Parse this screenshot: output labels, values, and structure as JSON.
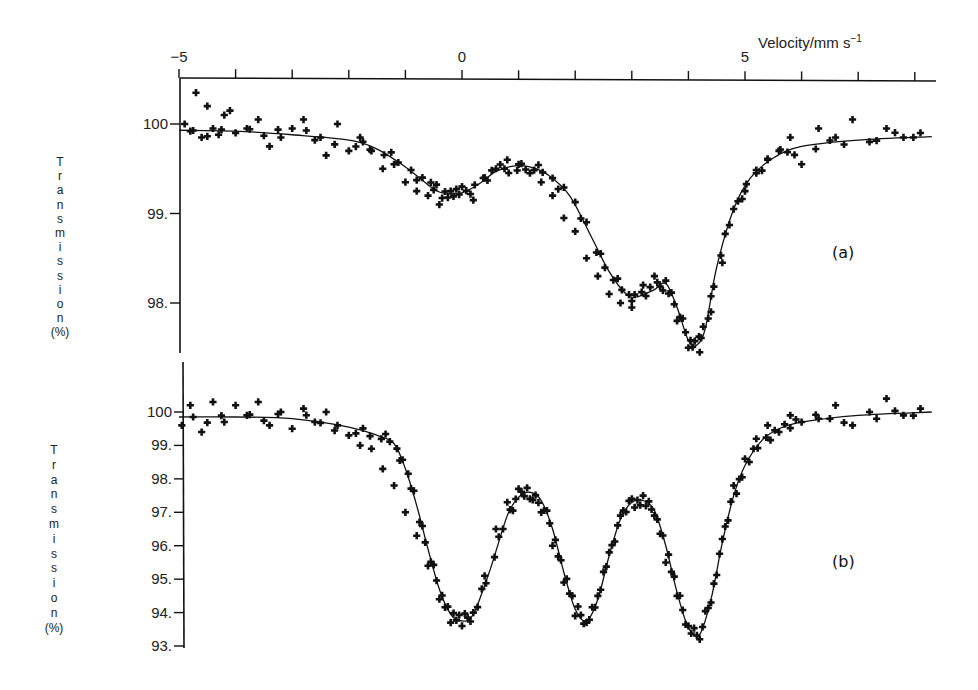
{
  "figure": {
    "x_axis_title": "Velocity/mm s",
    "x_axis_title_sup": "−1",
    "x_ticks_labeled": [
      {
        "value": -5,
        "label": "−5"
      },
      {
        "value": 0,
        "label": "0"
      },
      {
        "value": 5,
        "label": "5"
      }
    ],
    "x_tick_step": 1,
    "x_range": [
      -5,
      8.3
    ],
    "y_axis_title_letters": [
      "T",
      "r",
      "a",
      "n",
      "s",
      "m",
      "i",
      "s",
      "s",
      "i",
      "o",
      "n"
    ],
    "y_axis_unit": "(%)"
  },
  "chart_data": [
    {
      "type": "scatter",
      "panel_label": "(a)",
      "title": "",
      "xlabel": "Velocity/mm s^-1",
      "ylabel": "Transmission (%)",
      "xlim": [
        -5,
        8.3
      ],
      "ylim": [
        97.4,
        100.6
      ],
      "y_ticks": [
        {
          "value": 100,
          "label": "100"
        },
        {
          "value": 99,
          "label": "99."
        },
        {
          "value": 98,
          "label": "98."
        }
      ],
      "grid": false,
      "legend": null,
      "series": [
        {
          "name": "fit",
          "kind": "line",
          "x": [
            -5.0,
            -4.0,
            -3.0,
            -2.0,
            -1.5,
            -1.0,
            -0.6,
            -0.4,
            -0.2,
            0.0,
            0.3,
            0.6,
            0.9,
            1.2,
            1.5,
            1.9,
            2.3,
            2.6,
            2.9,
            3.1,
            3.4,
            3.6,
            3.8,
            4.0,
            4.15,
            4.3,
            4.5,
            4.8,
            5.1,
            5.5,
            6.0,
            7.0,
            8.3
          ],
          "y": [
            99.93,
            99.92,
            99.88,
            99.82,
            99.72,
            99.52,
            99.32,
            99.24,
            99.22,
            99.23,
            99.33,
            99.47,
            99.53,
            99.52,
            99.44,
            99.2,
            98.72,
            98.35,
            98.1,
            98.07,
            98.15,
            98.22,
            97.95,
            97.58,
            97.53,
            97.72,
            98.4,
            99.05,
            99.4,
            99.62,
            99.75,
            99.82,
            99.86
          ]
        },
        {
          "name": "measured",
          "kind": "scatter",
          "marker": "+",
          "x": [
            -4.9,
            -4.8,
            -4.7,
            -4.6,
            -4.5,
            -4.4,
            -4.3,
            -4.2,
            -4.1,
            -4.0,
            -3.8,
            -3.6,
            -3.4,
            -3.2,
            -3.0,
            -2.8,
            -2.6,
            -2.4,
            -2.2,
            -2.0,
            -1.8,
            -1.6,
            -1.4,
            -1.2,
            -1.0,
            -0.8,
            -0.6,
            -0.4,
            -0.2,
            0.0,
            0.2,
            0.4,
            0.6,
            0.8,
            1.0,
            1.2,
            1.4,
            1.6,
            1.8,
            2.0,
            2.2,
            2.4,
            2.6,
            2.8,
            3.0,
            3.2,
            3.4,
            3.6,
            3.8,
            4.0,
            4.2,
            4.4,
            4.6,
            4.8,
            5.0,
            5.2,
            5.4,
            5.6,
            5.8,
            6.0,
            6.3,
            6.6,
            6.9,
            7.2,
            7.5,
            7.8,
            8.1
          ],
          "y": [
            100.0,
            99.92,
            100.35,
            99.85,
            100.2,
            99.95,
            99.88,
            100.1,
            100.15,
            99.9,
            99.95,
            100.05,
            99.75,
            99.85,
            99.95,
            100.05,
            99.82,
            99.65,
            100.0,
            99.7,
            99.85,
            99.7,
            99.5,
            99.55,
            99.35,
            99.25,
            99.2,
            99.1,
            99.25,
            99.3,
            99.15,
            99.4,
            99.5,
            99.6,
            99.55,
            99.45,
            99.35,
            99.2,
            98.95,
            98.8,
            98.5,
            98.3,
            98.1,
            98.0,
            97.95,
            98.2,
            98.3,
            98.25,
            97.8,
            97.5,
            97.45,
            97.9,
            98.45,
            99.05,
            99.25,
            99.45,
            99.6,
            99.7,
            99.85,
            99.55,
            99.95,
            99.85,
            100.05,
            99.8,
            99.95,
            99.85,
            99.9
          ]
        }
      ]
    },
    {
      "type": "scatter",
      "panel_label": "(b)",
      "title": "",
      "xlabel": "Velocity/mm s^-1",
      "ylabel": "Transmission (%)",
      "xlim": [
        -5,
        8.3
      ],
      "ylim": [
        93.0,
        101.5
      ],
      "y_ticks": [
        {
          "value": 100,
          "label": "100"
        },
        {
          "value": 99,
          "label": "99."
        },
        {
          "value": 98,
          "label": "98."
        },
        {
          "value": 97,
          "label": "97."
        },
        {
          "value": 96,
          "label": "96."
        },
        {
          "value": 95,
          "label": "95."
        },
        {
          "value": 94,
          "label": "94."
        },
        {
          "value": 93,
          "label": "93."
        }
      ],
      "grid": false,
      "legend": null,
      "series": [
        {
          "name": "fit",
          "kind": "line",
          "x": [
            -5.0,
            -4.0,
            -3.0,
            -2.0,
            -1.5,
            -1.2,
            -1.0,
            -0.8,
            -0.6,
            -0.4,
            -0.2,
            0.0,
            0.2,
            0.5,
            0.8,
            1.0,
            1.2,
            1.4,
            1.6,
            1.8,
            2.0,
            2.2,
            2.4,
            2.6,
            2.8,
            3.0,
            3.2,
            3.4,
            3.6,
            3.8,
            4.0,
            4.2,
            4.4,
            4.6,
            4.8,
            5.0,
            5.3,
            5.6,
            6.0,
            7.0,
            8.3
          ],
          "y": [
            99.85,
            99.85,
            99.8,
            99.55,
            99.3,
            99.05,
            98.3,
            97.2,
            95.9,
            94.7,
            93.95,
            93.75,
            93.95,
            95.3,
            96.9,
            97.45,
            97.6,
            97.35,
            96.5,
            95.2,
            94.1,
            93.75,
            94.4,
            95.7,
            96.8,
            97.3,
            97.35,
            97.05,
            96.0,
            94.6,
            93.55,
            93.35,
            94.4,
            96.1,
            97.5,
            98.4,
            99.15,
            99.5,
            99.7,
            99.9,
            100.0
          ]
        },
        {
          "name": "measured",
          "kind": "scatter",
          "marker": "+",
          "x": [
            -4.95,
            -4.8,
            -4.6,
            -4.4,
            -4.2,
            -4.0,
            -3.8,
            -3.6,
            -3.4,
            -3.2,
            -3.0,
            -2.8,
            -2.6,
            -2.4,
            -2.2,
            -2.0,
            -1.8,
            -1.6,
            -1.4,
            -1.2,
            -1.0,
            -0.8,
            -0.6,
            -0.4,
            -0.2,
            0.0,
            0.2,
            0.4,
            0.6,
            0.8,
            1.0,
            1.2,
            1.4,
            1.6,
            1.8,
            2.0,
            2.2,
            2.4,
            2.6,
            2.8,
            3.0,
            3.2,
            3.4,
            3.6,
            3.8,
            4.0,
            4.2,
            4.4,
            4.6,
            4.8,
            5.0,
            5.2,
            5.4,
            5.6,
            5.8,
            6.0,
            6.3,
            6.6,
            6.9,
            7.2,
            7.5,
            7.8,
            8.1
          ],
          "y": [
            99.6,
            100.2,
            99.4,
            100.3,
            99.7,
            100.2,
            99.9,
            100.3,
            99.6,
            100.0,
            99.5,
            100.1,
            99.7,
            100.0,
            99.6,
            99.3,
            99.0,
            98.9,
            98.3,
            97.8,
            97.0,
            96.3,
            95.4,
            94.4,
            93.7,
            93.6,
            94.0,
            95.1,
            96.5,
            97.3,
            97.7,
            97.4,
            97.0,
            96.0,
            94.9,
            93.9,
            93.7,
            94.5,
            95.8,
            96.9,
            97.4,
            97.5,
            96.9,
            95.5,
            94.5,
            93.6,
            93.2,
            94.3,
            96.2,
            97.8,
            98.6,
            99.2,
            99.6,
            99.4,
            99.9,
            99.7,
            99.8,
            100.2,
            99.6,
            100.0,
            100.4,
            99.9,
            100.1
          ]
        }
      ]
    }
  ]
}
